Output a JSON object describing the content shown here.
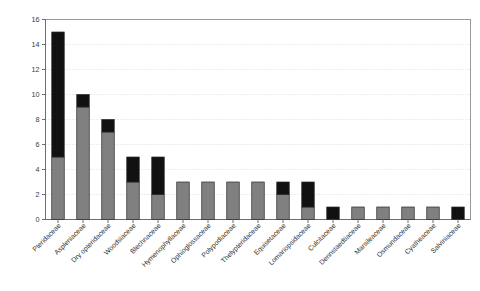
{
  "chart_data": {
    "type": "bar",
    "title": "",
    "subtitle": "",
    "xlabel": "",
    "ylabel": "",
    "ylim": [
      0,
      16
    ],
    "ytick_step": 2,
    "yticks": [
      "0",
      "2",
      "4",
      "6",
      "8",
      "10",
      "12",
      "14",
      "16"
    ],
    "grid": true,
    "stacked": true,
    "legend_position": "none",
    "categories": [
      "Pteridaceae",
      "Aspleniaceae",
      "Dry opteridaceae",
      "Woodsiaceae",
      "Blechnaceae",
      "Hymenophyllaceae",
      "Ophioglossaceae",
      "Polypodiaceae",
      "Thelypteridaceae",
      "Equisetaceae",
      "Lomariopsidaceae",
      "Culcitaceae",
      "Dennstaedtiaceae",
      "Marsileaceae",
      "Osmundaceae",
      "Cyatheaceae",
      "Salviniaceae"
    ],
    "series": [
      {
        "name": "gray-segment",
        "color": "#808080",
        "values": [
          5,
          9,
          7,
          3,
          2,
          3,
          3,
          3,
          3,
          2,
          1,
          0,
          1,
          1,
          1,
          1,
          0
        ]
      },
      {
        "name": "black-segment",
        "color": "#111111",
        "values": [
          10,
          1,
          1,
          2,
          3,
          0,
          0,
          0,
          0,
          1,
          2,
          1,
          0,
          0,
          0,
          0,
          1
        ]
      }
    ],
    "totals": [
      15,
      10,
      8,
      5,
      5,
      3,
      3,
      3,
      3,
      3,
      3,
      1,
      1,
      1,
      1,
      1,
      1
    ]
  },
  "colors": {
    "gray": "#808080",
    "black": "#111111",
    "grid": "#d8d8d8",
    "frame": "#9a9a9a",
    "axis": "#6e6e6e",
    "text": "#2e2e2e",
    "background": "#ffffff"
  }
}
